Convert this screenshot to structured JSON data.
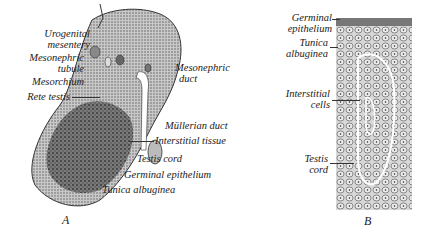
{
  "figure_a": {
    "caption": "A",
    "labels_left": [
      {
        "line1": "Urogenital",
        "line2": "mesentery"
      },
      {
        "line1": "Mesonephric",
        "line2": "tubule"
      },
      {
        "line1": "Mesorchium"
      },
      {
        "line1": "Rete testis"
      }
    ],
    "labels_right": [
      {
        "line1": "Mesonephric",
        "line2": "duct"
      },
      {
        "line1": "Müllerian duct"
      },
      {
        "line1": "Interstitial tissue"
      },
      {
        "line1": "Testis cord"
      },
      {
        "line1": "Germinal epithelium"
      },
      {
        "line1": "Tunica albuginea"
      }
    ]
  },
  "figure_b": {
    "caption": "B",
    "labels": [
      {
        "line1": "Germinal",
        "line2": "epithelium"
      },
      {
        "line1": "Tunica",
        "line2": "albuginea"
      },
      {
        "line1": "Interstitial",
        "line2": "cells"
      },
      {
        "line1": "Testis",
        "line2": "cord"
      }
    ]
  }
}
